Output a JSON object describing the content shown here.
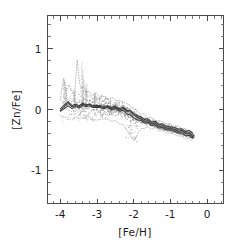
{
  "chart_data": {
    "type": "line",
    "title": "",
    "xlabel": "[Fe/H]",
    "ylabel": "[Zn/Fe]",
    "xlim": [
      -4.35,
      0.45
    ],
    "ylim": [
      -1.55,
      1.55
    ],
    "xticks": [
      -4,
      -3,
      -2,
      -1,
      0
    ],
    "xticklabels": [
      "-4",
      "-3",
      "-2",
      "-1",
      "0"
    ],
    "yticks": [
      -1,
      0,
      1
    ],
    "yticklabels": [
      "-1",
      "0",
      "1"
    ],
    "minor_ticks_per_major_x": 5,
    "minor_ticks_per_major_y": 5,
    "grid": false,
    "legend": null,
    "frame": "box-all-sides-inward-ticks",
    "series": [
      {
        "name": "model-track-1",
        "style": "solid-dark",
        "x": [
          -4.0,
          -3.9,
          -3.8,
          -3.7,
          -3.6,
          -3.5,
          -3.4,
          -3.3,
          -3.2,
          -3.1,
          -3.0,
          -2.9,
          -2.8,
          -2.7,
          -2.6,
          -2.5,
          -2.4,
          -2.3,
          -2.2,
          -2.1,
          -2.0,
          -1.9,
          -1.8,
          -1.7,
          -1.6,
          -1.5,
          -1.4,
          -1.3,
          -1.2,
          -1.1,
          -1.0,
          -0.9,
          -0.8,
          -0.7,
          -0.6,
          -0.5,
          -0.4,
          -0.35
        ],
        "y": [
          -0.02,
          0.05,
          0.09,
          0.06,
          0.05,
          0.06,
          0.07,
          0.08,
          0.07,
          0.06,
          0.05,
          0.05,
          0.04,
          0.04,
          0.03,
          0.02,
          0.01,
          0.0,
          -0.02,
          -0.05,
          -0.09,
          -0.13,
          -0.16,
          -0.18,
          -0.2,
          -0.22,
          -0.24,
          -0.26,
          -0.28,
          -0.3,
          -0.31,
          -0.33,
          -0.35,
          -0.36,
          -0.38,
          -0.4,
          -0.43,
          -0.44
        ]
      },
      {
        "name": "model-track-2",
        "style": "solid-dark",
        "x": [
          -4.0,
          -3.9,
          -3.8,
          -3.7,
          -3.6,
          -3.5,
          -3.4,
          -3.3,
          -3.2,
          -3.1,
          -3.0,
          -2.9,
          -2.8,
          -2.7,
          -2.6,
          -2.5,
          -2.4,
          -2.3,
          -2.2,
          -2.1,
          -2.0,
          -1.9,
          -1.8,
          -1.7,
          -1.6,
          -1.5,
          -1.4,
          -1.3,
          -1.2,
          -1.1,
          -1.0,
          -0.9,
          -0.8,
          -0.7,
          -0.6,
          -0.5,
          -0.4,
          -0.35
        ],
        "y": [
          -0.03,
          0.02,
          0.05,
          0.03,
          0.03,
          0.04,
          0.05,
          0.06,
          0.05,
          0.04,
          0.03,
          0.03,
          0.02,
          0.02,
          0.01,
          0.0,
          -0.01,
          -0.03,
          -0.06,
          -0.1,
          -0.14,
          -0.17,
          -0.19,
          -0.21,
          -0.23,
          -0.25,
          -0.27,
          -0.29,
          -0.31,
          -0.33,
          -0.34,
          -0.36,
          -0.38,
          -0.4,
          -0.42,
          -0.44,
          -0.46,
          -0.47
        ]
      },
      {
        "name": "model-track-3",
        "style": "solid-dark",
        "x": [
          -4.0,
          -3.9,
          -3.8,
          -3.7,
          -3.6,
          -3.5,
          -3.4,
          -3.3,
          -3.2,
          -3.1,
          -3.0,
          -2.9,
          -2.8,
          -2.7,
          -2.6,
          -2.5,
          -2.4,
          -2.3,
          -2.2,
          -2.1,
          -2.0,
          -1.9,
          -1.8,
          -1.7,
          -1.6,
          -1.5,
          -1.4,
          -1.3,
          -1.2,
          -1.1,
          -1.0,
          -0.9,
          -0.8,
          -0.7,
          -0.6,
          -0.5,
          -0.4
        ],
        "y": [
          0.01,
          0.08,
          0.12,
          0.08,
          0.07,
          0.08,
          0.09,
          0.09,
          0.08,
          0.07,
          0.07,
          0.06,
          0.06,
          0.05,
          0.05,
          0.04,
          0.03,
          0.02,
          0.0,
          -0.03,
          -0.07,
          -0.1,
          -0.13,
          -0.15,
          -0.17,
          -0.19,
          -0.21,
          -0.23,
          -0.25,
          -0.27,
          -0.29,
          -0.3,
          -0.32,
          -0.33,
          -0.35,
          -0.36,
          -0.38
        ]
      },
      {
        "name": "scatter-envelope-upper",
        "style": "dotted-grey",
        "x": [
          -4.0,
          -3.92,
          -3.85,
          -3.78,
          -3.7,
          -3.62,
          -3.55,
          -3.48,
          -3.42,
          -3.35,
          -3.28,
          -3.2,
          -3.1,
          -3.0,
          -2.9,
          -2.8,
          -2.7,
          -2.6,
          -2.5,
          -2.4,
          -2.3,
          -2.2,
          -2.1,
          -2.0,
          -1.9,
          -1.8,
          -1.7,
          -1.6,
          -1.5,
          -1.4,
          -1.3,
          -1.2,
          -1.1,
          -1.0,
          -0.9,
          -0.8,
          -0.7,
          -0.6,
          -0.5,
          -0.4
        ],
        "y": [
          0.16,
          0.52,
          0.3,
          0.42,
          0.28,
          0.35,
          0.8,
          0.45,
          0.33,
          0.4,
          0.26,
          0.3,
          0.24,
          0.26,
          0.22,
          0.2,
          0.19,
          0.18,
          0.16,
          0.14,
          0.12,
          0.1,
          0.06,
          0.02,
          -0.02,
          -0.06,
          -0.09,
          -0.12,
          -0.14,
          -0.17,
          -0.19,
          -0.21,
          -0.23,
          -0.25,
          -0.27,
          -0.29,
          -0.31,
          -0.33,
          -0.35,
          -0.37
        ]
      },
      {
        "name": "scatter-envelope-lower",
        "style": "dotted-grey",
        "x": [
          -4.0,
          -3.9,
          -3.8,
          -3.7,
          -3.6,
          -3.5,
          -3.4,
          -3.3,
          -3.2,
          -3.1,
          -3.0,
          -2.9,
          -2.8,
          -2.7,
          -2.6,
          -2.5,
          -2.4,
          -2.3,
          -2.2,
          -2.1,
          -2.0,
          -1.9,
          -1.8,
          -1.7,
          -1.6,
          -1.5,
          -1.4,
          -1.3,
          -1.2,
          -1.1,
          -1.0,
          -0.9,
          -0.8,
          -0.7,
          -0.6,
          -0.5,
          -0.4
        ],
        "y": [
          -0.1,
          -0.12,
          -0.14,
          -0.16,
          -0.14,
          -0.13,
          -0.15,
          -0.14,
          -0.13,
          -0.15,
          -0.18,
          -0.16,
          -0.15,
          -0.17,
          -0.18,
          -0.2,
          -0.22,
          -0.26,
          -0.33,
          -0.45,
          -0.52,
          -0.4,
          -0.32,
          -0.3,
          -0.3,
          -0.31,
          -0.32,
          -0.34,
          -0.36,
          -0.38,
          -0.39,
          -0.41,
          -0.43,
          -0.45,
          -0.47,
          -0.49,
          -0.51
        ]
      }
    ],
    "scatter_points": {
      "name": "stellar-abundance-points",
      "style": "dotted-grey",
      "description": "Dense dotted scatter cloud concentrated between [Fe/H] = -4.0 and -1.8, spanning [Zn/Fe] from about -0.5 to +0.9 with narrow vertical spikes near [Fe/H] = -3.9 and -3.4."
    }
  }
}
